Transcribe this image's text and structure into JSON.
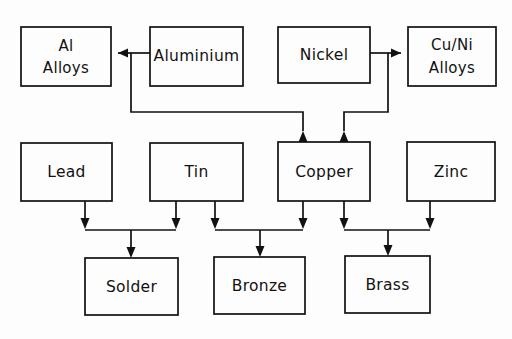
{
  "diagram": {
    "type": "flowchart",
    "background_color": "#fdfdfd",
    "line_color": "#111111",
    "text_color": "#121212",
    "nodes": [
      {
        "id": "al_alloys",
        "label": "Al\nAlloys",
        "line1": "Al",
        "line2": "Alloys",
        "x": 21,
        "y": 27,
        "w": 90,
        "h": 59,
        "multiline": true
      },
      {
        "id": "aluminium",
        "label": "Aluminium",
        "line1": "Aluminium",
        "line2": "",
        "x": 150,
        "y": 27,
        "w": 93,
        "h": 59,
        "multiline": false
      },
      {
        "id": "nickel",
        "label": "Nickel",
        "line1": "Nickel",
        "line2": "",
        "x": 278,
        "y": 27,
        "w": 92,
        "h": 56,
        "multiline": false
      },
      {
        "id": "cu_ni_alloys",
        "label": "Cu/Ni\nAlloys",
        "line1": "Cu/Ni",
        "line2": "Alloys",
        "x": 408,
        "y": 27,
        "w": 88,
        "h": 59,
        "multiline": true
      },
      {
        "id": "lead",
        "label": "Lead",
        "line1": "Lead",
        "line2": "",
        "x": 21,
        "y": 143,
        "w": 91,
        "h": 58,
        "multiline": false
      },
      {
        "id": "tin",
        "label": "Tin",
        "line1": "Tin",
        "line2": "",
        "x": 150,
        "y": 143,
        "w": 93,
        "h": 58,
        "multiline": false
      },
      {
        "id": "copper",
        "label": "Copper",
        "line1": "Copper",
        "line2": "",
        "x": 278,
        "y": 142,
        "w": 92,
        "h": 59,
        "multiline": false
      },
      {
        "id": "zinc",
        "label": "Zinc",
        "line1": "Zinc",
        "line2": "",
        "x": 407,
        "y": 142,
        "w": 88,
        "h": 59,
        "multiline": false
      },
      {
        "id": "solder",
        "label": "Solder",
        "line1": "Solder",
        "line2": "",
        "x": 85,
        "y": 258,
        "w": 93,
        "h": 57,
        "multiline": false
      },
      {
        "id": "bronze",
        "label": "Bronze",
        "line1": "Bronze",
        "line2": "",
        "x": 214,
        "y": 257,
        "w": 91,
        "h": 57,
        "multiline": false
      },
      {
        "id": "brass",
        "label": "Brass",
        "line1": "Brass",
        "line2": "",
        "x": 345,
        "y": 256,
        "w": 85,
        "h": 57,
        "multiline": false
      }
    ],
    "edges": [
      {
        "id": "aluminium-to-al-alloys",
        "from": "aluminium",
        "to": "al_alloys",
        "direction": "left"
      },
      {
        "id": "nickel-to-cu-ni-alloys",
        "from": "nickel",
        "to": "cu_ni_alloys",
        "direction": "right"
      },
      {
        "id": "copper-to-aluminium-line",
        "from": "copper",
        "to": "aluminium",
        "direction": "up"
      },
      {
        "id": "copper-to-nickel-line",
        "from": "copper",
        "to": "nickel",
        "direction": "up"
      },
      {
        "id": "lead-to-solder",
        "from": "lead",
        "to": "solder",
        "direction": "down"
      },
      {
        "id": "tin-to-solder",
        "from": "tin",
        "to": "solder",
        "direction": "down"
      },
      {
        "id": "tin-to-bronze",
        "from": "tin",
        "to": "bronze",
        "direction": "down"
      },
      {
        "id": "copper-to-bronze",
        "from": "copper",
        "to": "bronze",
        "direction": "down"
      },
      {
        "id": "copper-to-brass",
        "from": "copper",
        "to": "brass",
        "direction": "down"
      },
      {
        "id": "zinc-to-brass",
        "from": "zinc",
        "to": "brass",
        "direction": "down"
      }
    ]
  }
}
